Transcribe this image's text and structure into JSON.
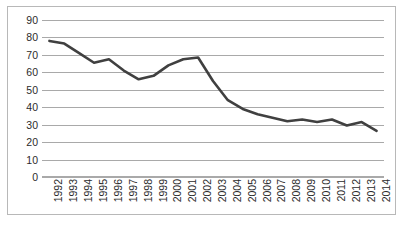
{
  "chart_data": {
    "type": "line",
    "title": "",
    "subtitle": "",
    "xlabel": "",
    "ylabel": "",
    "grid": true,
    "grid_orientation": "horizontal",
    "legend": false,
    "legend_position": "none",
    "xlim_categories": [
      "1992",
      "2014"
    ],
    "ylim": [
      0,
      90
    ],
    "y_tick_step": 10,
    "y_ticks": [
      90,
      80,
      70,
      60,
      50,
      40,
      30,
      20,
      10,
      0
    ],
    "y_tick_labels": [
      "90",
      "80",
      "70",
      "60",
      "50",
      "40",
      "30",
      "20",
      "10",
      "0"
    ],
    "categories": [
      "1992",
      "1993",
      "1994",
      "1995",
      "1996",
      "1997",
      "1998",
      "1999",
      "2000",
      "2001",
      "2002",
      "2003",
      "2004",
      "2005",
      "2006",
      "2007",
      "2008",
      "2009",
      "2010",
      "2011",
      "2012",
      "2013",
      "2014"
    ],
    "x_tick_labels": [
      "1992",
      "1993",
      "1994",
      "1995",
      "1996",
      "1997",
      "1998",
      "1999",
      "2000",
      "2001",
      "2002",
      "2003",
      "2004",
      "2005",
      "2006",
      "2007",
      "2008",
      "2009",
      "2010",
      "2011",
      "2012",
      "2013",
      "2014"
    ],
    "x_tick_label_rotation": -90,
    "series": [
      {
        "name": "series-1",
        "color": "#404040",
        "line_width": 2.6,
        "markers": false,
        "values": [
          78,
          76.5,
          71,
          65.5,
          67.5,
          61,
          56,
          58,
          64,
          67.5,
          68.5,
          55,
          44,
          39,
          36,
          34,
          32,
          33,
          31.5,
          33,
          29.5,
          31.5,
          26.5
        ]
      }
    ],
    "annotations": []
  },
  "style": {
    "background_color": "#ffffff",
    "border_color": "#b8b8b8",
    "gridline_color": "#a9a9a9",
    "tick_label_color": "#2b2b2b",
    "series_color": "#404040"
  }
}
